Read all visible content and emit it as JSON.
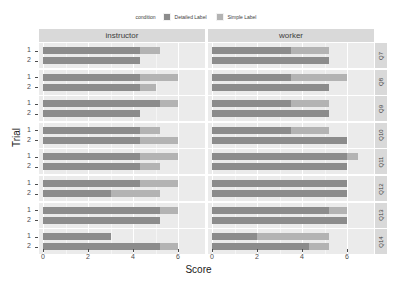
{
  "chart_data": {
    "type": "bar",
    "title": "",
    "xlabel": "Score",
    "ylabel": "Trial",
    "orientation": "horizontal",
    "xlim": [
      0,
      7
    ],
    "xticks": [
      0,
      2,
      4,
      6
    ],
    "grid": true,
    "legend": {
      "title": "condition",
      "position": "top",
      "entries": [
        {
          "name": "Detailed Label",
          "color": "#8c8c8c"
        },
        {
          "name": "Simple Label",
          "color": "#b3b3b3"
        }
      ]
    },
    "facet_columns": [
      "instructor",
      "worker"
    ],
    "facet_rows": [
      "Q7",
      "Q8",
      "Q9",
      "Q10",
      "Q11",
      "Q12",
      "Q13",
      "Q14"
    ],
    "trials": [
      "1",
      "2"
    ],
    "series": [
      {
        "name": "Detailed Label",
        "color": "#8c8c8c"
      },
      {
        "name": "Simple Label",
        "color": "#b3b3b3"
      }
    ],
    "panels": [
      {
        "question": "Q7",
        "instructor": {
          "trial1": {
            "Detailed Label": 4.3,
            "Simple Label": 5.2
          },
          "trial2": {
            "Detailed Label": 4.3,
            "Simple Label": 3.0
          }
        },
        "worker": {
          "trial1": {
            "Detailed Label": 3.5,
            "Simple Label": 5.2
          },
          "trial2": {
            "Detailed Label": 5.2,
            "Simple Label": 3.5
          }
        }
      },
      {
        "question": "Q8",
        "instructor": {
          "trial1": {
            "Detailed Label": 4.3,
            "Simple Label": 6.0
          },
          "trial2": {
            "Detailed Label": 4.3,
            "Simple Label": 5.0
          }
        },
        "worker": {
          "trial1": {
            "Detailed Label": 3.5,
            "Simple Label": 6.0
          },
          "trial2": {
            "Detailed Label": 5.2,
            "Simple Label": 4.5
          }
        }
      },
      {
        "question": "Q9",
        "instructor": {
          "trial1": {
            "Detailed Label": 5.2,
            "Simple Label": 6.0
          },
          "trial2": {
            "Detailed Label": 4.3,
            "Simple Label": 4.3
          }
        },
        "worker": {
          "trial1": {
            "Detailed Label": 3.5,
            "Simple Label": 5.2
          },
          "trial2": {
            "Detailed Label": 5.2,
            "Simple Label": 4.3
          }
        }
      },
      {
        "question": "Q10",
        "instructor": {
          "trial1": {
            "Detailed Label": 4.3,
            "Simple Label": 5.2
          },
          "trial2": {
            "Detailed Label": 4.3,
            "Simple Label": 6.0
          }
        },
        "worker": {
          "trial1": {
            "Detailed Label": 3.5,
            "Simple Label": 5.2
          },
          "trial2": {
            "Detailed Label": 6.0,
            "Simple Label": 5.2
          }
        }
      },
      {
        "question": "Q11",
        "instructor": {
          "trial1": {
            "Detailed Label": 4.3,
            "Simple Label": 6.0
          },
          "trial2": {
            "Detailed Label": 4.3,
            "Simple Label": 5.2
          }
        },
        "worker": {
          "trial1": {
            "Detailed Label": 6.0,
            "Simple Label": 6.5
          },
          "trial2": {
            "Detailed Label": 6.0,
            "Simple Label": 5.2
          }
        }
      },
      {
        "question": "Q12",
        "instructor": {
          "trial1": {
            "Detailed Label": 4.3,
            "Simple Label": 6.0
          },
          "trial2": {
            "Detailed Label": 3.0,
            "Simple Label": 5.2
          }
        },
        "worker": {
          "trial1": {
            "Detailed Label": 6.0,
            "Simple Label": 6.0
          },
          "trial2": {
            "Detailed Label": 6.0,
            "Simple Label": 6.0
          }
        }
      },
      {
        "question": "Q13",
        "instructor": {
          "trial1": {
            "Detailed Label": 5.2,
            "Simple Label": 6.0
          },
          "trial2": {
            "Detailed Label": 5.2,
            "Simple Label": 5.2
          }
        },
        "worker": {
          "trial1": {
            "Detailed Label": 5.2,
            "Simple Label": 6.0
          },
          "trial2": {
            "Detailed Label": 6.0,
            "Simple Label": 6.0
          }
        }
      },
      {
        "question": "Q14",
        "instructor": {
          "trial1": {
            "Detailed Label": 3.0,
            "Simple Label": 3.0
          },
          "trial2": {
            "Detailed Label": 5.2,
            "Simple Label": 6.0
          }
        },
        "worker": {
          "trial1": {
            "Detailed Label": 2.0,
            "Simple Label": 5.2
          },
          "trial2": {
            "Detailed Label": 4.3,
            "Simple Label": 5.2
          }
        }
      }
    ]
  },
  "axes": {
    "x_title": "Score",
    "y_title": "Trial",
    "x_tick_labels": [
      "0",
      "2",
      "4",
      "6"
    ],
    "y_tick_labels": [
      "1",
      "2"
    ]
  },
  "legend": {
    "title": "condition",
    "items": [
      {
        "label": "Detailed Label",
        "color": "#8c8c8c"
      },
      {
        "label": "Simple Label",
        "color": "#b3b3b3"
      }
    ]
  },
  "facets": {
    "columns": [
      {
        "label": "instructor"
      },
      {
        "label": "worker"
      }
    ],
    "rows": [
      {
        "label": "Q7"
      },
      {
        "label": "Q8"
      },
      {
        "label": "Q9"
      },
      {
        "label": "Q10"
      },
      {
        "label": "Q11"
      },
      {
        "label": "Q12"
      },
      {
        "label": "Q13"
      },
      {
        "label": "Q14"
      }
    ]
  }
}
